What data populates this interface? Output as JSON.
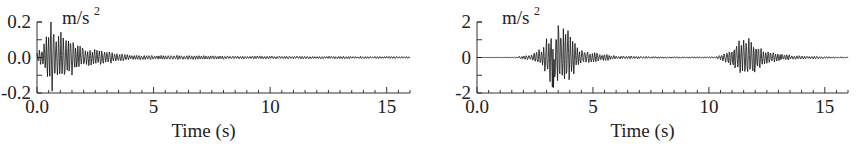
{
  "chart_data": [
    {
      "type": "line",
      "title": "",
      "unit_label": "m/s",
      "unit_superscript": "2",
      "xlabel": "Time (s)",
      "ylabel": "m/s²",
      "xlim": [
        0,
        16
      ],
      "ylim": [
        -0.2,
        0.2
      ],
      "x_ticks": [
        0,
        5,
        10,
        15
      ],
      "x_tick_labels": [
        "0.0",
        "5",
        "10",
        "15"
      ],
      "x_minor_step": 0.5,
      "y_ticks": [
        -0.2,
        0.0,
        0.2
      ],
      "y_tick_labels": [
        "-0.2",
        "0.0",
        "0.2"
      ],
      "y_minor_step": 0.1,
      "grid": false,
      "series": [
        {
          "name": "acceleration",
          "description": "Strong burst at 0–1.5 s peaking ~0.2 m/s², decaying to ~0.01 m/s² by 4 s, low-level ripple to 16 s",
          "envelope": [
            {
              "t": 0.0,
              "amp": 0.03
            },
            {
              "t": 0.3,
              "amp": 0.08
            },
            {
              "t": 0.6,
              "amp": 0.2
            },
            {
              "t": 0.9,
              "amp": 0.15
            },
            {
              "t": 1.3,
              "amp": 0.13
            },
            {
              "t": 2.0,
              "amp": 0.06
            },
            {
              "t": 3.0,
              "amp": 0.04
            },
            {
              "t": 4.0,
              "amp": 0.015
            },
            {
              "t": 8.0,
              "amp": 0.01
            },
            {
              "t": 16.0,
              "amp": 0.006
            }
          ],
          "peak": {
            "t": 0.6,
            "value": 0.2
          },
          "trough": {
            "t": 0.65,
            "value": -0.19
          }
        }
      ]
    },
    {
      "type": "line",
      "title": "",
      "unit_label": "m/s",
      "unit_superscript": "2",
      "xlabel": "Time (s)",
      "ylabel": "m/s²",
      "xlim": [
        0,
        16
      ],
      "ylim": [
        -2,
        2
      ],
      "x_ticks": [
        0,
        5,
        10,
        15
      ],
      "x_tick_labels": [
        "0.0",
        "5",
        "10",
        "15"
      ],
      "x_minor_step": 0.5,
      "y_ticks": [
        -2,
        0,
        2
      ],
      "y_tick_labels": [
        "-2",
        "0",
        "2"
      ],
      "y_minor_step": 1,
      "grid": false,
      "series": [
        {
          "name": "acceleration",
          "description": "Quiet until ~2 s, main burst 2.5–4.5 s peaking ~1.8 m/s², decay to 6 s, second burst 10.5–13 s peaking ~1.3 m/s²",
          "envelope": [
            {
              "t": 0.0,
              "amp": 0.0
            },
            {
              "t": 1.5,
              "amp": 0.02
            },
            {
              "t": 2.3,
              "amp": 0.15
            },
            {
              "t": 2.8,
              "amp": 0.6
            },
            {
              "t": 3.2,
              "amp": 1.7
            },
            {
              "t": 3.5,
              "amp": 1.8
            },
            {
              "t": 3.9,
              "amp": 1.6
            },
            {
              "t": 4.4,
              "amp": 0.5
            },
            {
              "t": 5.0,
              "amp": 0.3
            },
            {
              "t": 6.0,
              "amp": 0.1
            },
            {
              "t": 8.0,
              "amp": 0.05
            },
            {
              "t": 10.3,
              "amp": 0.05
            },
            {
              "t": 10.7,
              "amp": 0.3
            },
            {
              "t": 11.3,
              "amp": 1.0
            },
            {
              "t": 11.8,
              "amp": 1.3
            },
            {
              "t": 12.3,
              "amp": 0.5
            },
            {
              "t": 13.0,
              "amp": 0.25
            },
            {
              "t": 14.0,
              "amp": 0.1
            },
            {
              "t": 16.0,
              "amp": 0.03
            }
          ],
          "peak": {
            "t": 3.5,
            "value": 1.8
          },
          "trough": {
            "t": 3.3,
            "value": -1.7
          }
        }
      ]
    }
  ]
}
